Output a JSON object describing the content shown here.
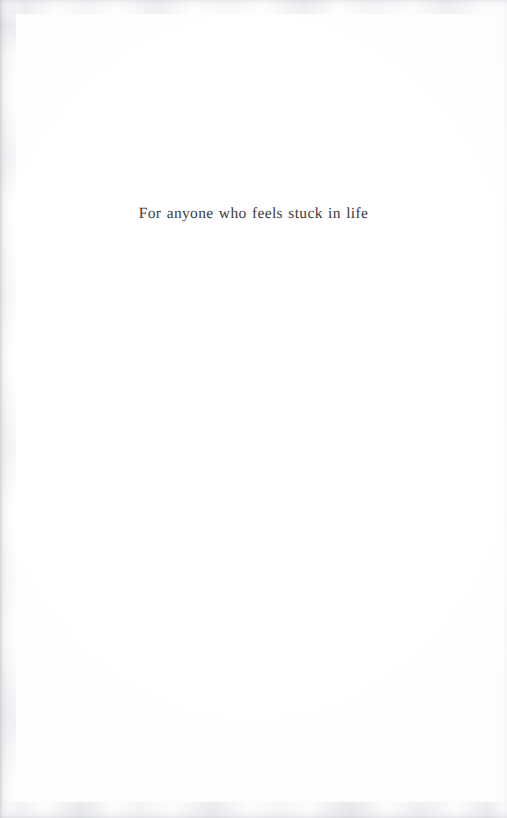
{
  "document": {
    "type": "book-dedication-page",
    "page_background": "#ffffff",
    "text_color": "#3b3b3e"
  },
  "dedication": {
    "line": "For anyone who feels stuck in life"
  },
  "artifacts": {
    "left_edge": "scan-edge-shadow",
    "top_edge": "scan-edge-noise",
    "bottom_edge": "scan-edge-noise",
    "right_edge": "scan-edge-faint"
  }
}
